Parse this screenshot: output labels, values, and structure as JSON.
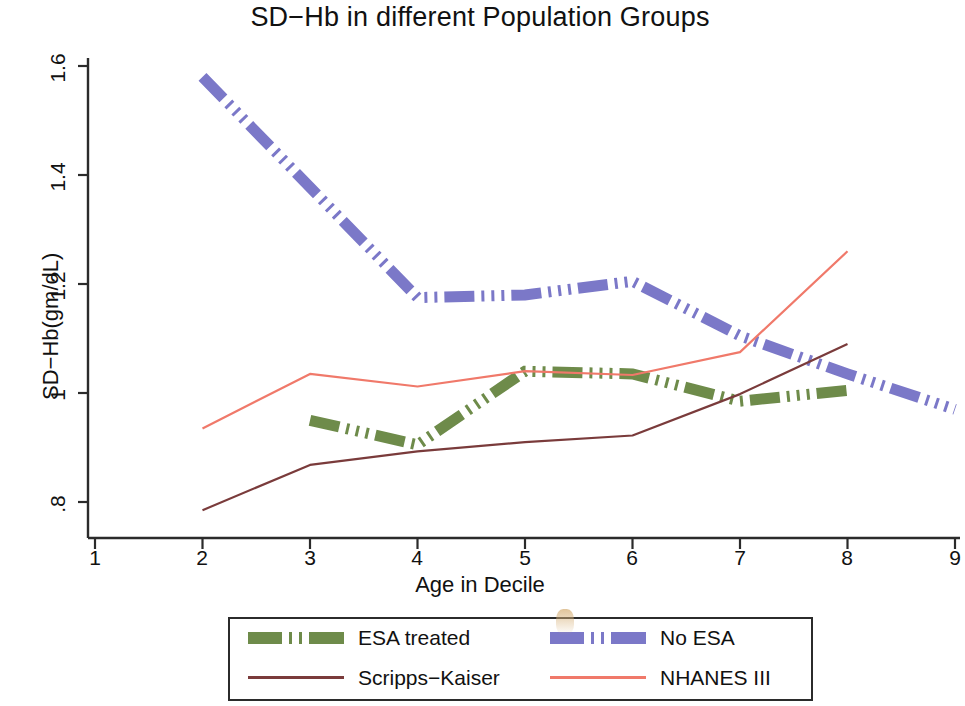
{
  "chart_data": {
    "type": "line",
    "title": "SD−Hb in different Population Groups",
    "xlabel": "Age in Decile",
    "ylabel": "SD−Hb(gm/dL)",
    "xlim": [
      1,
      9
    ],
    "ylim": [
      0.75,
      1.63
    ],
    "xticks": [
      1,
      2,
      3,
      4,
      5,
      6,
      7,
      8,
      9
    ],
    "xticklabels": [
      "1",
      "2",
      "3",
      "4",
      "5",
      "6",
      "7",
      "8",
      "9"
    ],
    "yticks": [
      0.8,
      1.0,
      1.2,
      1.4,
      1.6
    ],
    "yticklabels": [
      ".8",
      "1",
      "1.2",
      "1.4",
      "1.6"
    ],
    "grid": false,
    "legend_position": "below-axes",
    "series": [
      {
        "name": "ESA treated",
        "color": "#6e8b4a",
        "style": "dash-dot-thick",
        "x": [
          3,
          4,
          5,
          6,
          7,
          8
        ],
        "values": [
          0.95,
          0.905,
          1.04,
          1.035,
          0.985,
          1.005
        ]
      },
      {
        "name": "No ESA",
        "color": "#7b78c8",
        "style": "dash-dot-thick",
        "x": [
          2,
          4,
          5,
          6,
          7,
          8,
          9
        ],
        "values": [
          1.58,
          1.175,
          1.18,
          1.205,
          1.105,
          1.035,
          0.97
        ]
      },
      {
        "name": "Scripps−Kaiser",
        "color": "#7a3b3b",
        "style": "solid-thin",
        "x": [
          2,
          3,
          4,
          5,
          6,
          7,
          8
        ],
        "values": [
          0.785,
          0.868,
          0.893,
          0.91,
          0.922,
          0.998,
          1.09
        ]
      },
      {
        "name": "NHANES III",
        "color": "#f0796a",
        "style": "solid-thin",
        "x": [
          2,
          3,
          4,
          5,
          6,
          7,
          8
        ],
        "values": [
          0.935,
          1.035,
          1.012,
          1.04,
          1.033,
          1.075,
          1.26
        ]
      }
    ]
  },
  "legend": {
    "entries": [
      {
        "label": "ESA treated",
        "color": "#6e8b4a",
        "style": "dash-dot-thick"
      },
      {
        "label": "No ESA",
        "color": "#7b78c8",
        "style": "dash-dot-thick"
      },
      {
        "label": "Scripps−Kaiser",
        "color": "#7a3b3b",
        "style": "solid-thin"
      },
      {
        "label": "NHANES III",
        "color": "#f0796a",
        "style": "solid-thin"
      }
    ]
  },
  "axes": {
    "title": "SD−Hb in different Population Groups",
    "xlabel": "Age in Decile",
    "ylabel": "SD−Hb(gm/dL)",
    "xtick_labels": [
      "1",
      "2",
      "3",
      "4",
      "5",
      "6",
      "7",
      "8",
      "9"
    ],
    "ytick_labels": [
      ".8",
      "1",
      "1.2",
      "1.4",
      "1.6"
    ]
  },
  "colors": {
    "esa_treated": "#6e8b4a",
    "no_esa": "#7b78c8",
    "scripps_kaiser": "#7a3b3b",
    "nhanes_iii": "#f0796a",
    "axis": "#2b2b2b",
    "text": "#111111"
  }
}
